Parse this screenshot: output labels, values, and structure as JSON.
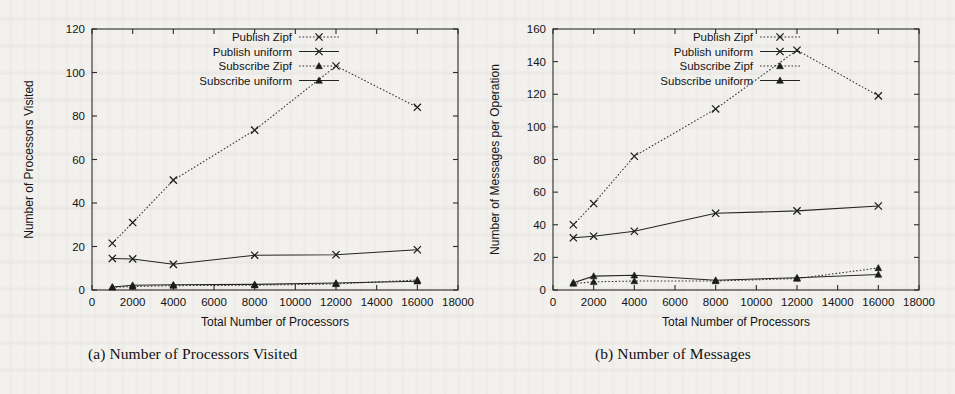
{
  "figure": {
    "caption_a": "(a) Number of Processors Visited",
    "caption_b": "(b) Number of Messages"
  },
  "colors": {
    "background": "#f2f1ee",
    "ink": "#1c1c1c",
    "frame": "#2b2b2b"
  },
  "legend": {
    "publish_zipf": "Publish Zipf",
    "publish_uniform": "Publish uniform",
    "subscribe_zipf": "Subscribe Zipf",
    "subscribe_uniform": "Subscribe uniform"
  },
  "chart_data": [
    {
      "type": "line",
      "id": "chart-a",
      "title": "(a) Number of Processors Visited",
      "xlabel": "Total Number of Processors",
      "ylabel": "Number of Processors Visited",
      "xlim": [
        0,
        18000
      ],
      "ylim": [
        0,
        120
      ],
      "xticks": [
        0,
        2000,
        4000,
        6000,
        8000,
        10000,
        12000,
        14000,
        16000,
        18000
      ],
      "yticks": [
        0,
        20,
        40,
        60,
        80,
        100,
        120
      ],
      "xticklabels": [
        "0",
        "2000",
        "4000",
        "6000",
        "8000",
        "10000",
        "12000",
        "14000",
        "16000",
        "18000"
      ],
      "yticklabels": [
        "0",
        "20",
        "40",
        "60",
        "80",
        "100",
        "120"
      ],
      "grid": false,
      "legend_position": "top-center",
      "x": [
        1000,
        2000,
        4000,
        8000,
        12000,
        16000
      ],
      "series": [
        {
          "name": "Publish Zipf",
          "style": "dotted",
          "marker": "x",
          "values": [
            21.5,
            31.0,
            50.5,
            73.5,
            103.0,
            84.0
          ]
        },
        {
          "name": "Publish uniform",
          "style": "solid",
          "marker": "x",
          "values": [
            14.5,
            14.3,
            11.8,
            16.0,
            16.2,
            18.5
          ]
        },
        {
          "name": "Subscribe Zipf",
          "style": "dotted",
          "marker": "triangle",
          "values": [
            1.2,
            1.6,
            2.0,
            2.2,
            2.8,
            4.6
          ]
        },
        {
          "name": "Subscribe uniform",
          "style": "solid",
          "marker": "triangle",
          "values": [
            1.4,
            2.2,
            2.4,
            2.6,
            3.2,
            4.0
          ]
        }
      ]
    },
    {
      "type": "line",
      "id": "chart-b",
      "title": "(b) Number of Messages",
      "xlabel": "Total Number of Processors",
      "ylabel": "Number of Messages per Operation",
      "xlim": [
        0,
        18000
      ],
      "ylim": [
        0,
        160
      ],
      "xticks": [
        0,
        2000,
        4000,
        6000,
        8000,
        10000,
        12000,
        14000,
        16000,
        18000
      ],
      "yticks": [
        0,
        20,
        40,
        60,
        80,
        100,
        120,
        140,
        160
      ],
      "xticklabels": [
        "0",
        "2000",
        "4000",
        "6000",
        "8000",
        "10000",
        "12000",
        "14000",
        "16000",
        "18000"
      ],
      "yticklabels": [
        "0",
        "20",
        "40",
        "60",
        "80",
        "100",
        "120",
        "140",
        "160"
      ],
      "grid": false,
      "legend_position": "top-center",
      "x": [
        1000,
        2000,
        4000,
        8000,
        12000,
        16000
      ],
      "series": [
        {
          "name": "Publish Zipf",
          "style": "dotted",
          "marker": "x",
          "values": [
            40.0,
            53.0,
            82.0,
            111.0,
            147.0,
            119.0
          ]
        },
        {
          "name": "Publish uniform",
          "style": "solid",
          "marker": "x",
          "values": [
            32.0,
            33.0,
            36.0,
            47.0,
            48.5,
            51.5
          ]
        },
        {
          "name": "Subscribe Zipf",
          "style": "dotted",
          "marker": "triangle",
          "values": [
            4.0,
            5.0,
            5.5,
            5.5,
            7.0,
            13.5
          ]
        },
        {
          "name": "Subscribe uniform",
          "style": "solid",
          "marker": "triangle",
          "values": [
            4.5,
            8.5,
            9.0,
            6.0,
            7.5,
            9.5
          ]
        }
      ]
    }
  ]
}
